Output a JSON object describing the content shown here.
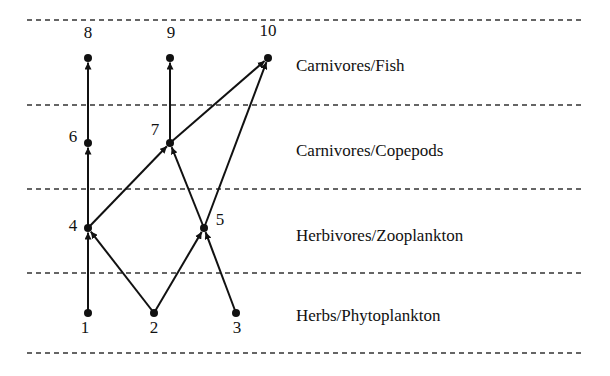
{
  "levels": [
    {
      "label": "Carnivores/Fish",
      "y": 66
    },
    {
      "label": "Carnivores/Copepods",
      "y": 151
    },
    {
      "label": "Herbivores/Zooplankton",
      "y": 236
    },
    {
      "label": "Herbs/Phytoplankton",
      "y": 316
    }
  ],
  "dividers_y": [
    20,
    105,
    189,
    273,
    353
  ],
  "nodes": [
    {
      "id": "1",
      "x": 88,
      "y": 313,
      "lx": 85,
      "ly": 328
    },
    {
      "id": "2",
      "x": 154,
      "y": 313,
      "lx": 154,
      "ly": 328
    },
    {
      "id": "3",
      "x": 236,
      "y": 313,
      "lx": 237,
      "ly": 328
    },
    {
      "id": "4",
      "x": 88,
      "y": 228,
      "lx": 73,
      "ly": 226
    },
    {
      "id": "5",
      "x": 204,
      "y": 228,
      "lx": 220,
      "ly": 220
    },
    {
      "id": "6",
      "x": 88,
      "y": 143,
      "lx": 73,
      "ly": 137
    },
    {
      "id": "7",
      "x": 170,
      "y": 143,
      "lx": 155,
      "ly": 130
    },
    {
      "id": "8",
      "x": 88,
      "y": 58,
      "lx": 88,
      "ly": 33
    },
    {
      "id": "9",
      "x": 170,
      "y": 58,
      "lx": 171,
      "ly": 33
    },
    {
      "id": "10",
      "x": 268,
      "y": 58,
      "lx": 268,
      "ly": 31
    }
  ],
  "edges": [
    {
      "from": "1",
      "to": "4"
    },
    {
      "from": "2",
      "to": "4"
    },
    {
      "from": "2",
      "to": "5"
    },
    {
      "from": "3",
      "to": "5"
    },
    {
      "from": "4",
      "to": "6"
    },
    {
      "from": "4",
      "to": "7"
    },
    {
      "from": "5",
      "to": "7"
    },
    {
      "from": "5",
      "to": "10"
    },
    {
      "from": "6",
      "to": "8"
    },
    {
      "from": "7",
      "to": "9"
    },
    {
      "from": "7",
      "to": "10"
    }
  ]
}
